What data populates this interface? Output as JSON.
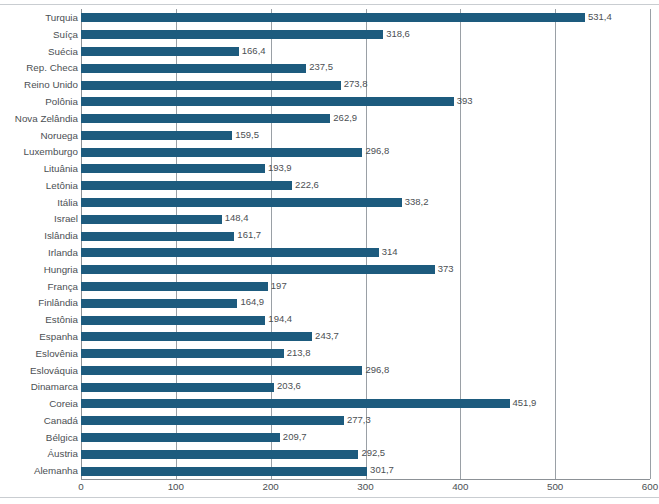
{
  "chart_data": {
    "type": "bar",
    "orientation": "horizontal",
    "title": "",
    "subtitle": "",
    "xlabel": "",
    "ylabel": "",
    "xlim": [
      0,
      600
    ],
    "xticks": [
      0,
      100,
      200,
      300,
      400,
      500,
      600
    ],
    "xtick_labels": [
      "0",
      "100",
      "200",
      "300",
      "400",
      "500",
      "600"
    ],
    "grid": true,
    "grid_axis": "x",
    "legend": null,
    "bar_color": "#1d5b7e",
    "label_color": "#4b4f53",
    "grid_color": "#9aa0a6",
    "decimal_separator": ",",
    "categories": [
      "Turquia",
      "Suíça",
      "Suécia",
      "Rep. Checa",
      "Reino Unido",
      "Polônia",
      "Nova Zelândia",
      "Noruega",
      "Luxemburgo",
      "Lituânia",
      "Letônia",
      "Itália",
      "Israel",
      "Islândia",
      "Irlanda",
      "Hungria",
      "França",
      "Finlândia",
      "Estônia",
      "Espanha",
      "Eslovênia",
      "Eslováquia",
      "Dinamarca",
      "Coreia",
      "Canadá",
      "Bélgica",
      "Áustria",
      "Alemanha"
    ],
    "values": [
      531.4,
      318.6,
      166.4,
      237.5,
      273.8,
      393,
      262.9,
      159.5,
      296.8,
      193.9,
      222.6,
      338.2,
      148.4,
      161.7,
      314,
      373,
      197,
      164.9,
      194.4,
      243.7,
      213.8,
      296.8,
      203.6,
      451.9,
      277.3,
      209.7,
      292.5,
      301.7
    ],
    "value_labels": [
      "531,4",
      "318,6",
      "166,4",
      "237,5",
      "273,8",
      "393",
      "262,9",
      "159,5",
      "296,8",
      "193,9",
      "222,6",
      "338,2",
      "148,4",
      "161,7",
      "314",
      "373",
      "197",
      "164,9",
      "194,4",
      "243,7",
      "213,8",
      "296,8",
      "203,6",
      "451,9",
      "277,3",
      "209,7",
      "292,5",
      "301,7"
    ]
  }
}
